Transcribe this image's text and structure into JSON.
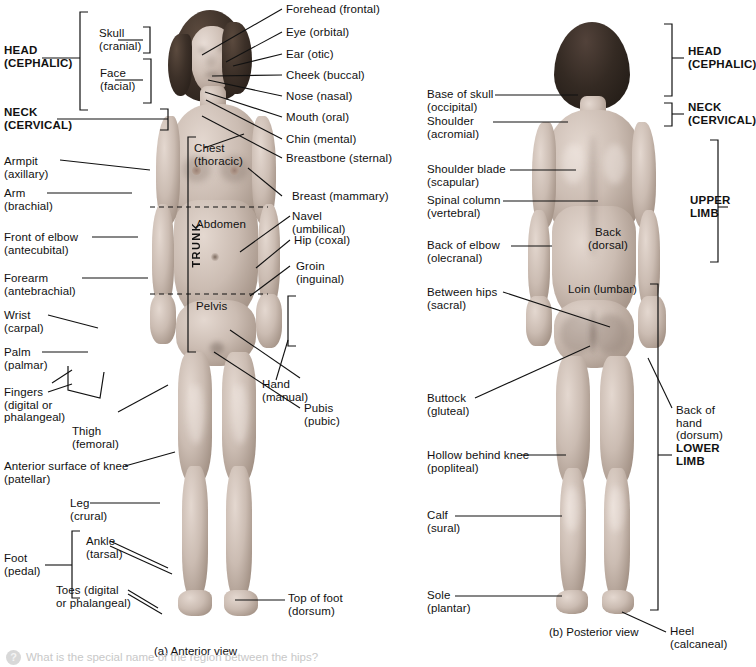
{
  "figure": {
    "anterior_caption": "(a) Anterior view",
    "posterior_caption": "(b) Posterior view"
  },
  "anterior": {
    "region_brackets": [
      {
        "name": "head",
        "label": "HEAD\n(CEPHALIC)"
      },
      {
        "name": "neck",
        "label": "NECK\n(CERVICAL)"
      },
      {
        "name": "skull",
        "label": "Skull\n(cranial)"
      },
      {
        "name": "face",
        "label": "Face\n(facial)"
      },
      {
        "name": "foot",
        "label": "Foot\n(pedal)"
      }
    ],
    "trunk_label": "TRUNK",
    "trunk_parts": [
      {
        "name": "chest",
        "label": "Chest\n(thoracic)"
      },
      {
        "name": "abdomen",
        "label": "Abdomen"
      },
      {
        "name": "pelvis",
        "label": "Pelvis"
      }
    ],
    "left_labels": [
      {
        "name": "armpit",
        "label": "Armpit\n(axillary)"
      },
      {
        "name": "arm",
        "label": "Arm\n(brachial)"
      },
      {
        "name": "front-of-elbow",
        "label": "Front of elbow\n(antecubital)"
      },
      {
        "name": "forearm",
        "label": "Forearm\n(antebrachial)"
      },
      {
        "name": "wrist",
        "label": "Wrist\n(carpal)"
      },
      {
        "name": "palm",
        "label": "Palm\n(palmar)"
      },
      {
        "name": "fingers",
        "label": "Fingers\n(digital or\nphalangeal)"
      },
      {
        "name": "thigh",
        "label": "Thigh\n(femoral)"
      },
      {
        "name": "anterior-surface-of-knee",
        "label": "Anterior surface of knee\n(patellar)"
      },
      {
        "name": "leg",
        "label": "Leg\n(crural)"
      },
      {
        "name": "ankle",
        "label": "Ankle\n(tarsal)"
      },
      {
        "name": "toes",
        "label": "Toes (digital\nor phalangeal)"
      }
    ],
    "right_labels": [
      {
        "name": "forehead",
        "label": "Forehead (frontal)"
      },
      {
        "name": "eye",
        "label": "Eye (orbital)"
      },
      {
        "name": "ear",
        "label": "Ear (otic)"
      },
      {
        "name": "cheek",
        "label": "Cheek (buccal)"
      },
      {
        "name": "nose",
        "label": "Nose (nasal)"
      },
      {
        "name": "mouth",
        "label": "Mouth (oral)"
      },
      {
        "name": "chin",
        "label": "Chin (mental)"
      },
      {
        "name": "breastbone",
        "label": "Breastbone (sternal)"
      },
      {
        "name": "breast",
        "label": "Breast (mammary)"
      },
      {
        "name": "navel",
        "label": "Navel\n(umbilical)"
      },
      {
        "name": "hip",
        "label": "Hip (coxal)"
      },
      {
        "name": "groin",
        "label": "Groin\n(inguinal)"
      },
      {
        "name": "hand",
        "label": "Hand\n(manual)"
      },
      {
        "name": "pubis",
        "label": "Pubis\n(pubic)"
      },
      {
        "name": "top-of-foot",
        "label": "Top of foot\n(dorsum)"
      }
    ]
  },
  "posterior": {
    "left_labels": [
      {
        "name": "base-of-skull",
        "label": "Base of skull\n(occipital)"
      },
      {
        "name": "shoulder",
        "label": "Shoulder\n(acromial)"
      },
      {
        "name": "shoulder-blade",
        "label": "Shoulder blade\n(scapular)"
      },
      {
        "name": "spinal-column",
        "label": "Spinal column\n(vertebral)"
      },
      {
        "name": "back-of-elbow",
        "label": "Back of elbow\n(olecranal)"
      },
      {
        "name": "between-hips",
        "label": "Between hips\n(sacral)"
      },
      {
        "name": "buttock",
        "label": "Buttock\n(gluteal)"
      },
      {
        "name": "hollow-behind-knee",
        "label": "Hollow behind knee\n(popliteal)"
      },
      {
        "name": "calf",
        "label": "Calf\n(sural)"
      },
      {
        "name": "sole",
        "label": "Sole\n(plantar)"
      }
    ],
    "on_body_labels": [
      {
        "name": "back",
        "label": "Back\n(dorsal)"
      },
      {
        "name": "loin",
        "label": "Loin (lumbar)"
      }
    ],
    "right_labels": [
      {
        "name": "head",
        "label": "HEAD\n(CEPHALIC)",
        "bold": true
      },
      {
        "name": "neck",
        "label": "NECK\n(CERVICAL)",
        "bold": true
      },
      {
        "name": "upper-limb",
        "label": "UPPER\nLIMB",
        "bold": true
      },
      {
        "name": "lower-limb",
        "label": "LOWER\nLIMB",
        "bold": true
      },
      {
        "name": "back-of-hand",
        "label": "Back of\nhand\n(dorsum)",
        "bold": false
      },
      {
        "name": "heel",
        "label": "Heel\n(calcaneal)",
        "bold": false
      }
    ]
  },
  "footer": {
    "cut_off_text": "What is the special name of the region between the hips?"
  },
  "colors": {
    "line": "#111111",
    "text": "#111111",
    "background": "#ffffff"
  }
}
